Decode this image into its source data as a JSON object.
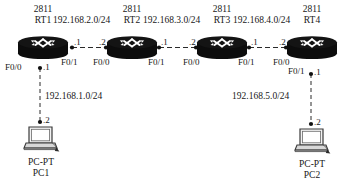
{
  "diagram": {
    "type": "network-topology",
    "background_color": "#ffffff",
    "line_color": "#2a2a2a",
    "device_color": "#101010",
    "link_style": "dashed"
  },
  "routers": [
    {
      "id": "RT1",
      "model": "2811",
      "name": "RT1",
      "interfaces": [
        {
          "port": "F0/1",
          "side": "right",
          "ip_last_octet": ".1"
        },
        {
          "port": "F0/0",
          "side": "bottom-left",
          "ip_last_octet": ".1"
        }
      ]
    },
    {
      "id": "RT2",
      "model": "2811",
      "name": "RT2",
      "interfaces": [
        {
          "port": "F0/0",
          "side": "left",
          "ip_last_octet": ".2"
        },
        {
          "port": "F0/1",
          "side": "right",
          "ip_last_octet": ".1"
        }
      ]
    },
    {
      "id": "RT3",
      "model": "2811",
      "name": "RT3",
      "interfaces": [
        {
          "port": "F0/0",
          "side": "left",
          "ip_last_octet": ".2"
        },
        {
          "port": "F0/1",
          "side": "right",
          "ip_last_octet": ".1"
        }
      ]
    },
    {
      "id": "RT4",
      "model": "2811",
      "name": "RT4",
      "interfaces": [
        {
          "port": "F0/0",
          "side": "left",
          "ip_last_octet": ".2"
        },
        {
          "port": "F0/1",
          "side": "bottom",
          "ip_last_octet": ".1"
        }
      ]
    }
  ],
  "hosts": [
    {
      "id": "PC1",
      "model": "PC-PT",
      "name": "PC1",
      "ip_last_octet": ".2"
    },
    {
      "id": "PC2",
      "model": "PC-PT",
      "name": "PC2",
      "ip_last_octet": ".2"
    }
  ],
  "networks": [
    {
      "cidr": "192.168.2.0/24",
      "from": "RT1",
      "to": "RT2",
      "orientation": "horizontal"
    },
    {
      "cidr": "192.168.3.0/24",
      "from": "RT2",
      "to": "RT3",
      "orientation": "horizontal"
    },
    {
      "cidr": "192.168.4.0/24",
      "from": "RT3",
      "to": "RT4",
      "orientation": "horizontal"
    },
    {
      "cidr": "192.168.1.0/24",
      "from": "RT1",
      "to": "PC1",
      "orientation": "vertical"
    },
    {
      "cidr": "192.168.5.0/24",
      "from": "RT4",
      "to": "PC2",
      "orientation": "vertical"
    }
  ],
  "labels": {
    "model_rt1": "2811",
    "name_rt1": "RT1",
    "model_rt2": "2811",
    "name_rt2": "RT2",
    "model_rt3": "2811",
    "name_rt3": "RT3",
    "model_rt4": "2811",
    "name_rt4": "RT4",
    "net_12": "192.168.2.0/24",
    "net_23": "192.168.3.0/24",
    "net_34": "192.168.4.0/24",
    "net_pc1": "192.168.1.0/24",
    "net_pc2": "192.168.5.0/24",
    "rt1_f01": "F0/1",
    "rt1_f00": "F0/0",
    "rt2_f00": "F0/0",
    "rt2_f01": "F0/1",
    "rt3_f00": "F0/0",
    "rt3_f01": "F0/1",
    "rt4_f00": "F0/0",
    "rt4_f01": "F0/1",
    "ip_rt1_right": ".1",
    "ip_rt1_down": ".1",
    "ip_rt2_left": ".2",
    "ip_rt2_right": ".1",
    "ip_rt3_left": ".2",
    "ip_rt3_right": ".1",
    "ip_rt4_left": ".2",
    "ip_rt4_down": ".1",
    "ip_pc1": ".2",
    "ip_pc2": ".2",
    "pc1_model": "PC-PT",
    "pc1_name": "PC1",
    "pc2_model": "PC-PT",
    "pc2_name": "PC2"
  }
}
